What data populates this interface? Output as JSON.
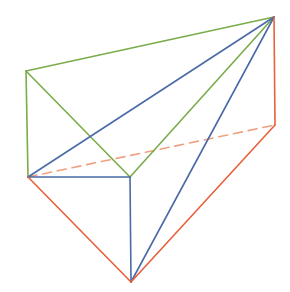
{
  "diagram": {
    "type": "wireframe-polyhedron",
    "colors": {
      "green": "#7aac4a",
      "blue": "#4a6aa8",
      "orange": "#e8603c",
      "orange_dashed": "#f0a080"
    },
    "vertices": {
      "A": [
        274,
        17
      ],
      "B": [
        26,
        71
      ],
      "C": [
        28,
        177
      ],
      "D": [
        130,
        177
      ],
      "E": [
        131,
        282
      ],
      "F": [
        275,
        125
      ]
    },
    "edges": [
      {
        "from": "A",
        "to": "B",
        "color": "green",
        "style": "solid"
      },
      {
        "from": "B",
        "to": "C",
        "color": "green",
        "style": "solid"
      },
      {
        "from": "B",
        "to": "D",
        "color": "green",
        "style": "solid"
      },
      {
        "from": "A",
        "to": "D",
        "color": "green",
        "style": "solid"
      },
      {
        "from": "A",
        "to": "C",
        "color": "blue",
        "style": "solid"
      },
      {
        "from": "C",
        "to": "D",
        "color": "blue",
        "style": "solid"
      },
      {
        "from": "D",
        "to": "E",
        "color": "blue",
        "style": "solid"
      },
      {
        "from": "A",
        "to": "E",
        "color": "blue",
        "style": "solid"
      },
      {
        "from": "A",
        "to": "F",
        "color": "orange",
        "style": "solid"
      },
      {
        "from": "C",
        "to": "E",
        "color": "orange",
        "style": "solid"
      },
      {
        "from": "E",
        "to": "F",
        "color": "orange",
        "style": "solid"
      },
      {
        "from": "C",
        "to": "F",
        "color": "orange_dashed",
        "style": "dashed"
      }
    ]
  }
}
